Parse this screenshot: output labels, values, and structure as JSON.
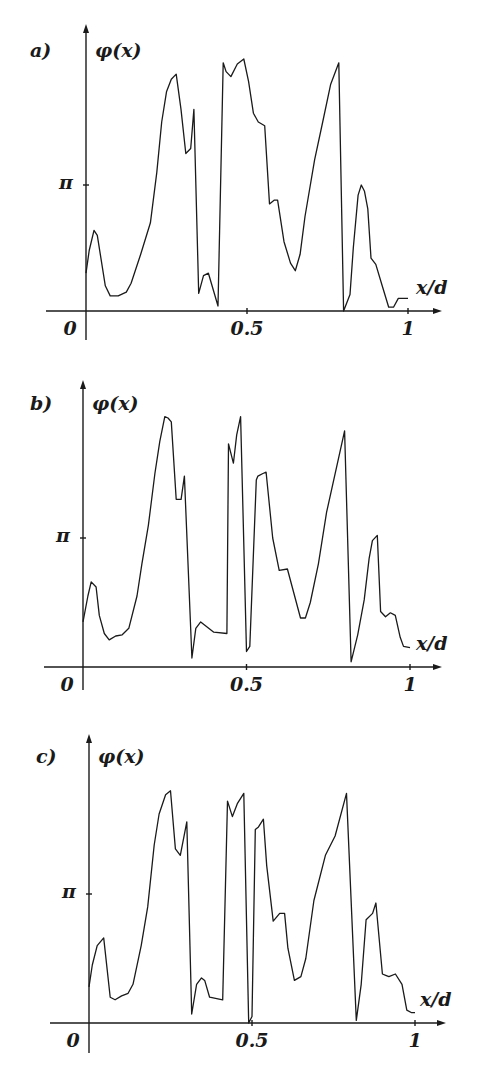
{
  "chart_data": [
    {
      "type": "line",
      "panel_label": "a)",
      "ylabel": "φ(x)",
      "xlabel": "x/d",
      "xticks": [
        "0",
        "0.5",
        "1"
      ],
      "yticks": [
        "π"
      ],
      "xlim": [
        0,
        1
      ],
      "ylim_in_pi": [
        0,
        2
      ],
      "series": [
        {
          "name": "phase",
          "x": [
            0.0,
            0.01,
            0.025,
            0.035,
            0.06,
            0.075,
            0.1,
            0.125,
            0.14,
            0.17,
            0.2,
            0.22,
            0.235,
            0.25,
            0.265,
            0.28,
            0.295,
            0.31,
            0.325,
            0.335,
            0.35,
            0.365,
            0.38,
            0.41,
            0.426,
            0.435,
            0.45,
            0.47,
            0.49,
            0.505,
            0.52,
            0.535,
            0.555,
            0.57,
            0.585,
            0.595,
            0.615,
            0.635,
            0.65,
            0.665,
            0.68,
            0.71,
            0.735,
            0.76,
            0.785,
            0.8,
            0.82,
            0.83,
            0.845,
            0.855,
            0.865,
            0.875,
            0.885,
            0.9,
            0.92,
            0.94,
            0.955,
            0.97,
            0.99,
            1.0
          ],
          "y_in_pi": [
            0.3,
            0.48,
            0.64,
            0.6,
            0.2,
            0.12,
            0.12,
            0.15,
            0.22,
            0.45,
            0.7,
            1.1,
            1.5,
            1.74,
            1.84,
            1.88,
            1.6,
            1.25,
            1.29,
            1.6,
            0.14,
            0.28,
            0.3,
            0.04,
            1.97,
            1.9,
            1.86,
            1.96,
            2.0,
            1.82,
            1.57,
            1.5,
            1.47,
            0.85,
            0.88,
            0.88,
            0.55,
            0.38,
            0.32,
            0.45,
            0.75,
            1.2,
            1.5,
            1.8,
            1.97,
            0.0,
            0.13,
            0.5,
            0.92,
            1.0,
            0.95,
            0.81,
            0.42,
            0.37,
            0.2,
            0.03,
            0.03,
            0.1,
            0.1,
            0.1
          ]
        }
      ]
    },
    {
      "type": "line",
      "panel_label": "b)",
      "ylabel": "φ(x)",
      "xlabel": "x/d",
      "xticks": [
        "0",
        "0.5",
        "1"
      ],
      "yticks": [
        "π"
      ],
      "xlim": [
        0,
        1
      ],
      "ylim_in_pi": [
        0,
        2
      ],
      "series": [
        {
          "name": "phase",
          "x": [
            0.0,
            0.015,
            0.025,
            0.04,
            0.05,
            0.065,
            0.08,
            0.1,
            0.12,
            0.14,
            0.165,
            0.18,
            0.2,
            0.22,
            0.235,
            0.25,
            0.26,
            0.27,
            0.285,
            0.3,
            0.31,
            0.333,
            0.345,
            0.36,
            0.4,
            0.44,
            0.445,
            0.46,
            0.47,
            0.482,
            0.5,
            0.51,
            0.53,
            0.535,
            0.55,
            0.56,
            0.58,
            0.6,
            0.625,
            0.665,
            0.68,
            0.695,
            0.72,
            0.745,
            0.8,
            0.82,
            0.84,
            0.86,
            0.875,
            0.885,
            0.9,
            0.91,
            0.925,
            0.94,
            0.955,
            0.97,
            0.98,
            1.0
          ],
          "y_in_pi": [
            0.35,
            0.55,
            0.66,
            0.62,
            0.4,
            0.26,
            0.21,
            0.24,
            0.25,
            0.3,
            0.55,
            0.8,
            1.1,
            1.5,
            1.75,
            1.94,
            1.93,
            1.9,
            1.3,
            1.3,
            1.48,
            0.07,
            0.3,
            0.35,
            0.27,
            0.26,
            1.73,
            1.58,
            1.8,
            1.94,
            0.12,
            0.16,
            1.45,
            1.48,
            1.5,
            1.51,
            1.0,
            0.75,
            0.76,
            0.38,
            0.38,
            0.5,
            0.8,
            1.2,
            1.83,
            0.04,
            0.25,
            0.52,
            0.84,
            0.98,
            1.02,
            0.43,
            0.39,
            0.42,
            0.4,
            0.23,
            0.16,
            0.15
          ]
        }
      ]
    },
    {
      "type": "line",
      "panel_label": "c)",
      "ylabel": "φ(x)",
      "xlabel": "x/d",
      "xticks": [
        "0",
        "0.5",
        "1"
      ],
      "yticks": [
        "π"
      ],
      "xlim": [
        0,
        1
      ],
      "ylim_in_pi": [
        0,
        2
      ],
      "series": [
        {
          "name": "phase",
          "x": [
            0.0,
            0.01,
            0.025,
            0.045,
            0.065,
            0.08,
            0.1,
            0.12,
            0.135,
            0.16,
            0.18,
            0.2,
            0.215,
            0.235,
            0.25,
            0.265,
            0.28,
            0.3,
            0.315,
            0.33,
            0.345,
            0.355,
            0.37,
            0.41,
            0.425,
            0.44,
            0.455,
            0.475,
            0.49,
            0.5,
            0.51,
            0.52,
            0.535,
            0.545,
            0.565,
            0.585,
            0.6,
            0.61,
            0.63,
            0.65,
            0.665,
            0.69,
            0.725,
            0.755,
            0.79,
            0.82,
            0.835,
            0.85,
            0.87,
            0.88,
            0.9,
            0.91,
            0.92,
            0.94,
            0.96,
            0.975,
            0.99,
            1.0
          ],
          "y_in_pi": [
            0.28,
            0.45,
            0.6,
            0.66,
            0.2,
            0.18,
            0.21,
            0.23,
            0.3,
            0.6,
            0.9,
            1.38,
            1.62,
            1.77,
            1.8,
            1.35,
            1.3,
            1.56,
            0.07,
            0.3,
            0.35,
            0.33,
            0.2,
            0.18,
            1.72,
            1.6,
            1.7,
            1.78,
            0.0,
            0.05,
            1.5,
            1.52,
            1.58,
            1.22,
            0.79,
            0.85,
            0.85,
            0.58,
            0.33,
            0.36,
            0.5,
            0.95,
            1.3,
            1.45,
            1.78,
            0.02,
            0.3,
            0.8,
            0.85,
            0.93,
            0.38,
            0.37,
            0.36,
            0.38,
            0.3,
            0.1,
            0.08,
            0.08
          ]
        }
      ]
    }
  ]
}
